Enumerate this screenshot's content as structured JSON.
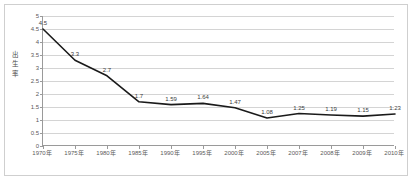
{
  "chart_data": {
    "type": "line",
    "title": "",
    "xlabel": "",
    "ylabel": "出生率",
    "categories": [
      "1970年",
      "1975年",
      "1980年",
      "1985年",
      "1990年",
      "1995年",
      "2000年",
      "2005年",
      "2007年",
      "2008年",
      "2009年",
      "2010年"
    ],
    "values": [
      4.5,
      3.3,
      2.7,
      1.7,
      1.59,
      1.64,
      1.47,
      1.08,
      1.25,
      1.19,
      1.15,
      1.23
    ],
    "point_labels": [
      "4.5",
      "3.3",
      "2.7",
      "1.7",
      "1.59",
      "1.64",
      "1.47",
      "1.08",
      "1.25",
      "1.19",
      "1.15",
      "1.23"
    ],
    "ylim": [
      0,
      5
    ],
    "ytick_values": [
      0,
      0.5,
      1,
      1.5,
      2,
      2.5,
      3,
      3.5,
      4,
      4.5,
      5
    ],
    "ytick_labels": [
      "0",
      "0.5",
      "1",
      "1.5",
      "2",
      "2.5",
      "3",
      "3.5",
      "4",
      "4.5",
      "5"
    ],
    "grid": true,
    "legend": false,
    "series_color": "#1a1a1a",
    "gridline_color": "#d4d4d4",
    "axis_color": "#9a9a9a",
    "frame_color": "#cfcfcf",
    "background_color": "#ffffff"
  }
}
